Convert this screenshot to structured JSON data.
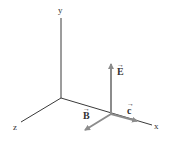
{
  "diagram": {
    "type": "3d-axes-electromagnetic-wave",
    "axes": [
      {
        "name": "y",
        "label": "y"
      },
      {
        "name": "z",
        "label": "z"
      },
      {
        "name": "x",
        "label": "x"
      }
    ],
    "vectors": [
      {
        "name": "E",
        "label": "E",
        "direction": "+y",
        "color": "#8c8c8c"
      },
      {
        "name": "B",
        "label": "B",
        "direction": "+z",
        "color": "#8c8c8c"
      },
      {
        "name": "c",
        "label": "c",
        "direction": "+x",
        "color": "#8c8c8c"
      }
    ],
    "arrow_glyph": "→",
    "colors": {
      "axis": "#3a3a3a",
      "vector": "#8c8c8c",
      "background": "#ffffff"
    }
  }
}
